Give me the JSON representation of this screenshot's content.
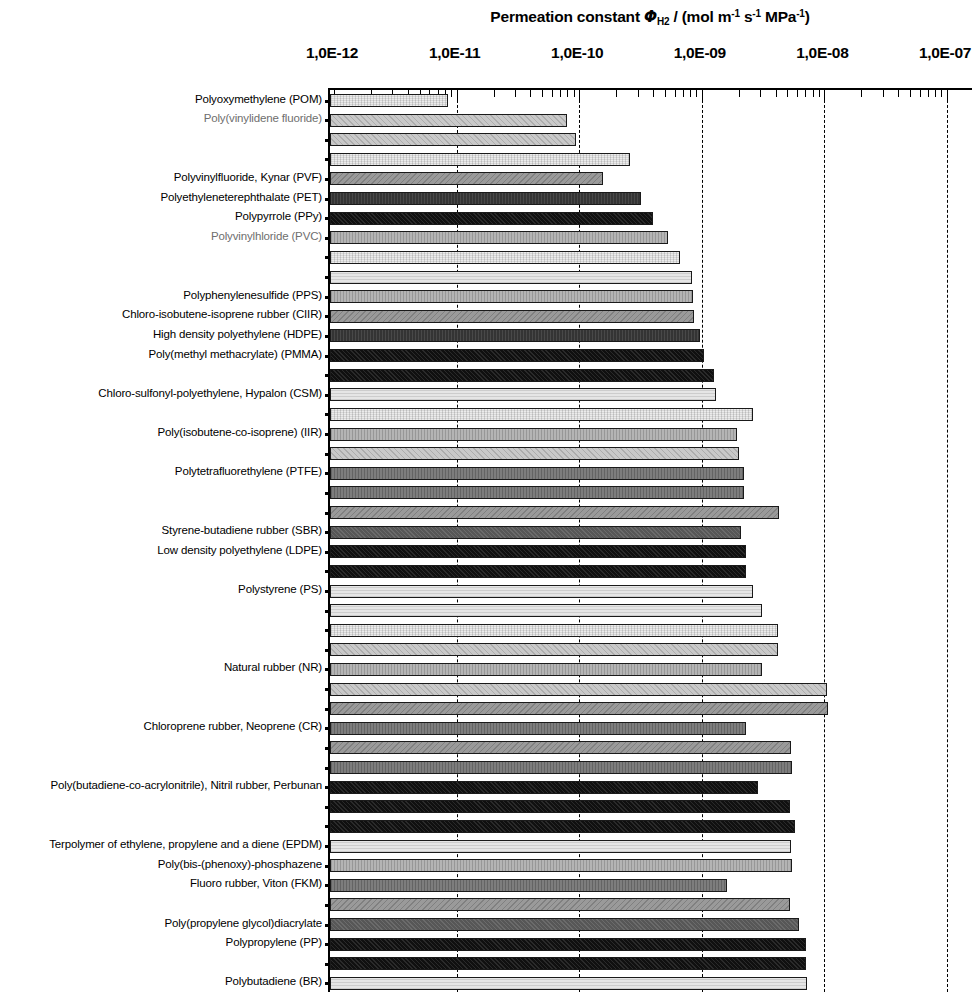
{
  "chart_data": {
    "type": "bar",
    "orientation": "horizontal",
    "title_parts": {
      "lead": "Permeation constant ",
      "phi": "Φ",
      "phi_sub": "H",
      "phi_sub2": "2",
      "mid": " / (mol m",
      "exp1": "-1",
      "s": " s",
      "exp2": "-1",
      "mpa": " MPa",
      "exp3": "-1",
      "close": ")"
    },
    "xlabel": "Permeation constant",
    "ylabel": "",
    "xscale": "log",
    "xlim": [
      1e-12,
      2.2e-07
    ],
    "xticks": [
      1e-12,
      1e-11,
      1e-10,
      1e-09,
      1e-08,
      1e-07
    ],
    "xtick_labels": [
      "1,0E-12",
      "1,0E-11",
      "1,0E-10",
      "1,0E-09",
      "1,0E-08",
      "1,0E-07"
    ],
    "grid": "major-vertical-dashed",
    "legend": "none",
    "bars": [
      {
        "label": "Polyoxymethylene (POM)",
        "label_shown": true,
        "label_color": "dark",
        "value": 8.5e-12,
        "fill": 0
      },
      {
        "label": "Poly(vinylidene fluoride)",
        "label_shown": true,
        "label_color": "light",
        "value": 8e-11,
        "fill": 1
      },
      {
        "label": "",
        "label_shown": false,
        "label_color": "dark",
        "value": 9.5e-11,
        "fill": 1
      },
      {
        "label": "",
        "label_shown": false,
        "label_color": "dark",
        "value": 2.6e-10,
        "fill": 0
      },
      {
        "label": "Polyvinylfluoride, Kynar (PVF)",
        "label_shown": true,
        "label_color": "dark",
        "value": 1.55e-10,
        "fill": 3
      },
      {
        "label": "Polyethyleneterephthalate (PET)",
        "label_shown": true,
        "label_color": "dark",
        "value": 3.2e-10,
        "fill": 6
      },
      {
        "label": "Polypyrrole (PPy)",
        "label_shown": true,
        "label_color": "dark",
        "value": 4e-10,
        "fill": 7
      },
      {
        "label": "Polyvinylhloride (PVC)",
        "label_shown": true,
        "label_color": "light",
        "value": 5.3e-10,
        "fill": 2
      },
      {
        "label": "",
        "label_shown": false,
        "label_color": "dark",
        "value": 6.6e-10,
        "fill": 0
      },
      {
        "label": "",
        "label_shown": false,
        "label_color": "dark",
        "value": 8.3e-10,
        "fill": 8
      },
      {
        "label": "Polyphenylenesulfide (PPS)",
        "label_shown": true,
        "label_color": "dark",
        "value": 8.4e-10,
        "fill": 2
      },
      {
        "label": "Chloro-isobutene-isoprene rubber (CIIR)",
        "label_shown": true,
        "label_color": "dark",
        "value": 8.6e-10,
        "fill": 3
      },
      {
        "label": "High density polyethylene (HDPE)",
        "label_shown": true,
        "label_color": "dark",
        "value": 9.7e-10,
        "fill": 6
      },
      {
        "label": "Poly(methyl methacrylate)  (PMMA)",
        "label_shown": true,
        "label_color": "dark",
        "value": 1.05e-09,
        "fill": 7
      },
      {
        "label": "",
        "label_shown": false,
        "label_color": "dark",
        "value": 1.25e-09,
        "fill": 7
      },
      {
        "label": "Chloro-sulfonyl-polyethylene, Hypalon (CSM)",
        "label_shown": true,
        "label_color": "dark",
        "value": 1.3e-09,
        "fill": 8
      },
      {
        "label": "",
        "label_shown": false,
        "label_color": "dark",
        "value": 2.6e-09,
        "fill": 0
      },
      {
        "label": "Poly(isobutene-co-isoprene)  (IIR)",
        "label_shown": true,
        "label_color": "dark",
        "value": 1.95e-09,
        "fill": 2
      },
      {
        "label": "",
        "label_shown": false,
        "label_color": "dark",
        "value": 2e-09,
        "fill": 1
      },
      {
        "label": "Polytetrafluorethylene (PTFE)",
        "label_shown": true,
        "label_color": "dark",
        "value": 2.2e-09,
        "fill": 4
      },
      {
        "label": "",
        "label_shown": false,
        "label_color": "dark",
        "value": 2.2e-09,
        "fill": 4
      },
      {
        "label": "",
        "label_shown": false,
        "label_color": "dark",
        "value": 4.3e-09,
        "fill": 3
      },
      {
        "label": "Styrene-butadiene rubber (SBR)",
        "label_shown": true,
        "label_color": "dark",
        "value": 2.1e-09,
        "fill": 5
      },
      {
        "label": "Low density polyethylene (LDPE)",
        "label_shown": true,
        "label_color": "dark",
        "value": 2.3e-09,
        "fill": 7
      },
      {
        "label": "",
        "label_shown": false,
        "label_color": "dark",
        "value": 2.3e-09,
        "fill": 7
      },
      {
        "label": "Polystyrene (PS)",
        "label_shown": true,
        "label_color": "dark",
        "value": 2.6e-09,
        "fill": 8
      },
      {
        "label": "",
        "label_shown": false,
        "label_color": "dark",
        "value": 3.1e-09,
        "fill": 8
      },
      {
        "label": "",
        "label_shown": false,
        "label_color": "dark",
        "value": 4.2e-09,
        "fill": 0
      },
      {
        "label": "",
        "label_shown": false,
        "label_color": "dark",
        "value": 4.2e-09,
        "fill": 1
      },
      {
        "label": "Natural rubber (NR)",
        "label_shown": true,
        "label_color": "dark",
        "value": 3.1e-09,
        "fill": 2
      },
      {
        "label": "",
        "label_shown": false,
        "label_color": "dark",
        "value": 1.05e-08,
        "fill": 1
      },
      {
        "label": "",
        "label_shown": false,
        "label_color": "dark",
        "value": 1.08e-08,
        "fill": 3
      },
      {
        "label": "Chloroprene rubber, Neoprene (CR)",
        "label_shown": true,
        "label_color": "dark",
        "value": 2.3e-09,
        "fill": 4
      },
      {
        "label": "",
        "label_shown": false,
        "label_color": "dark",
        "value": 5.3e-09,
        "fill": 3
      },
      {
        "label": "",
        "label_shown": false,
        "label_color": "dark",
        "value": 5.4e-09,
        "fill": 4
      },
      {
        "label": "Poly(butadiene-co-acrylonitrile),  Nitril rubber,  Perbunan",
        "label_shown": true,
        "label_color": "dark",
        "value": 2.9e-09,
        "fill": 7
      },
      {
        "label": "",
        "label_shown": false,
        "label_color": "dark",
        "value": 5.2e-09,
        "fill": 7
      },
      {
        "label": "",
        "label_shown": false,
        "label_color": "dark",
        "value": 5.8e-09,
        "fill": 7
      },
      {
        "label": "Terpolymer of ethylene, propylene and a diene (EPDM)",
        "label_shown": true,
        "label_color": "dark",
        "value": 5.3e-09,
        "fill": 8
      },
      {
        "label": "Poly(bis-(phenoxy)-phosphazene",
        "label_shown": true,
        "label_color": "dark",
        "value": 5.4e-09,
        "fill": 2
      },
      {
        "label": "Fluoro rubber, Viton (FKM)",
        "label_shown": true,
        "label_color": "dark",
        "value": 1.6e-09,
        "fill": 4
      },
      {
        "label": "",
        "label_shown": false,
        "label_color": "dark",
        "value": 5.2e-09,
        "fill": 3
      },
      {
        "label": "Poly(propylene glycol)diacrylate",
        "label_shown": true,
        "label_color": "dark",
        "value": 6.2e-09,
        "fill": 5
      },
      {
        "label": "Polypropylene (PP)",
        "label_shown": true,
        "label_color": "dark",
        "value": 7.1e-09,
        "fill": 7
      },
      {
        "label": "",
        "label_shown": false,
        "label_color": "dark",
        "value": 7.1e-09,
        "fill": 7
      },
      {
        "label": "Polybutadiene (BR)",
        "label_shown": true,
        "label_color": "dark",
        "value": 7.2e-09,
        "fill": 8
      },
      {
        "label": "",
        "label_shown": false,
        "label_color": "dark",
        "value": 7.2e-09,
        "fill": 8
      },
      {
        "label": "Silicone, polysiloxane",
        "label_shown": true,
        "label_color": "dark",
        "value": 7e-08,
        "fill": 2
      },
      {
        "label": "",
        "label_shown": false,
        "label_color": "dark",
        "value": 7.5e-08,
        "fill": 3
      },
      {
        "label": "",
        "label_shown": false,
        "label_color": "dark",
        "value": 1.4e-07,
        "fill": 2
      }
    ]
  }
}
